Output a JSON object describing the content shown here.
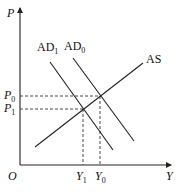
{
  "diagram": {
    "type": "economics-AD-AS",
    "axes": {
      "y_label": "P",
      "x_label": "Y",
      "origin_label": "O"
    },
    "curves": [
      {
        "id": "AS",
        "label": "AS"
      },
      {
        "id": "AD1",
        "label_main": "AD",
        "label_sub": "1"
      },
      {
        "id": "AD0",
        "label_main": "AD",
        "label_sub": "0"
      }
    ],
    "price_levels": [
      {
        "id": "P0",
        "label_main": "P",
        "label_sub": "0"
      },
      {
        "id": "P1",
        "label_main": "P",
        "label_sub": "1"
      }
    ],
    "output_levels": [
      {
        "id": "Y1",
        "label_main": "Y",
        "label_sub": "1"
      },
      {
        "id": "Y0",
        "label_main": "Y",
        "label_sub": "0"
      }
    ],
    "equilibria": [
      {
        "id": "E0",
        "curves": [
          "AD0",
          "AS"
        ],
        "price": "P0",
        "output": "Y0"
      },
      {
        "id": "E1",
        "curves": [
          "AD1",
          "AS"
        ],
        "price": "P1",
        "output": "Y1"
      }
    ]
  }
}
